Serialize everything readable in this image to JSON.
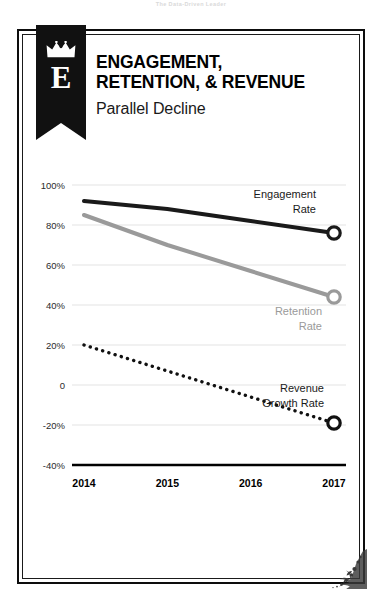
{
  "watermark": "The Data-Driven Leader",
  "logo": {
    "letter": "E",
    "crown_icon": "crown-icon"
  },
  "header": {
    "title_line_1": "ENGAGEMENT,",
    "title_line_2": "RETENTION, & REVENUE",
    "subtitle": "Parallel Decline"
  },
  "colors": {
    "engagement": "#1a1a1a",
    "retention": "#9a9a9a",
    "revenue": "#111111",
    "grid": "#e3e3e3",
    "axis": "#000000",
    "banner": "#111111"
  },
  "chart_data": {
    "type": "line",
    "title": "ENGAGEMENT, RETENTION, & REVENUE",
    "subtitle": "Parallel Decline",
    "xlabel": "",
    "ylabel": "",
    "x": [
      "2014",
      "2015",
      "2016",
      "2017"
    ],
    "categories": [
      "2014",
      "2015",
      "2016",
      "2017"
    ],
    "ylim": [
      -40,
      100
    ],
    "yticks": [
      100,
      80,
      60,
      40,
      20,
      0,
      -20,
      -40
    ],
    "ytick_labels": [
      "100%",
      "80%",
      "60%",
      "40%",
      "20%",
      "0",
      "-20%",
      "-40%"
    ],
    "grid": true,
    "legend": "inline-annotations",
    "series": [
      {
        "name": "Engagement Rate",
        "label": "Engagement\nRate",
        "label_line_1": "Engagement",
        "label_line_2": "Rate",
        "color": "#1a1a1a",
        "style": "solid",
        "width": 4,
        "marker": "open-circle",
        "marker_at": "2017",
        "values": [
          92,
          88,
          82,
          76
        ]
      },
      {
        "name": "Retention Rate",
        "label_line_1": "Retention",
        "label_line_2": "Rate",
        "color": "#9a9a9a",
        "style": "solid",
        "width": 4,
        "marker": "open-circle",
        "marker_at": "2017",
        "values": [
          85,
          70,
          57,
          44
        ]
      },
      {
        "name": "Revenue Growth Rate",
        "label_line_1": "Revenue",
        "label_line_2": "Growth Rate",
        "color": "#111111",
        "style": "dotted",
        "width": 3.4,
        "marker": "open-circle",
        "marker_at": "2017",
        "values": [
          20,
          7,
          -6,
          -19
        ]
      }
    ]
  }
}
